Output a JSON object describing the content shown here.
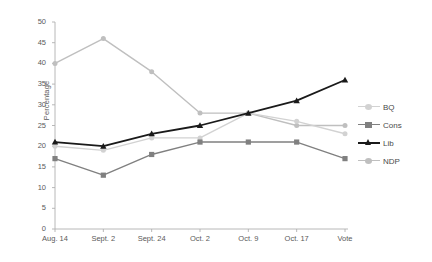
{
  "chart_data": {
    "type": "line",
    "title": "",
    "xlabel": "",
    "ylabel": "Percentage",
    "categories": [
      "Aug. 14",
      "Sept. 2",
      "Sept. 24",
      "Oct. 2",
      "Oct. 9",
      "Oct. 17",
      "Vote"
    ],
    "ylim": [
      0,
      50
    ],
    "yticks": [
      0,
      5,
      10,
      15,
      20,
      25,
      30,
      35,
      40,
      45,
      50
    ],
    "grid": false,
    "legend_position": "right",
    "series": [
      {
        "name": "BQ",
        "color": "#d2d2d2",
        "marker": "circle",
        "values": [
          20,
          19,
          22,
          22,
          28,
          26,
          23
        ]
      },
      {
        "name": "Cons",
        "color": "#808080",
        "marker": "square",
        "values": [
          17,
          13,
          18,
          21,
          21,
          21,
          17
        ]
      },
      {
        "name": "Lib",
        "color": "#1a1a1a",
        "marker": "triangle",
        "values": [
          21,
          20,
          23,
          25,
          28,
          31,
          36
        ]
      },
      {
        "name": "NDP",
        "color": "#bfbfbf",
        "marker": "circle",
        "values": [
          40,
          46,
          38,
          28,
          28,
          25,
          25
        ]
      }
    ]
  },
  "axis": {
    "y_tick_labels": [
      "50",
      "45",
      "40",
      "35",
      "30",
      "25",
      "20",
      "15",
      "10",
      "5",
      "0"
    ],
    "y_axis_title": "Percentage",
    "x_tick_labels": [
      "Aug. 14",
      "Sept. 2",
      "Sept. 24",
      "Oct. 2",
      "Oct. 9",
      "Oct. 17",
      "Vote"
    ]
  },
  "legend": {
    "entries": [
      {
        "label": "BQ"
      },
      {
        "label": "Cons"
      },
      {
        "label": "Lib"
      },
      {
        "label": "NDP"
      }
    ]
  },
  "colors": {
    "bq": "#d2d2d2",
    "cons": "#808080",
    "lib": "#1a1a1a",
    "ndp": "#bfbfbf",
    "axis": "#b0b0b0",
    "text": "#5a5a5a"
  }
}
